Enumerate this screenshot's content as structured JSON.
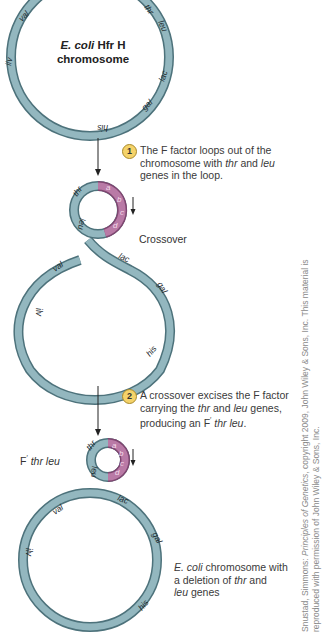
{
  "colors": {
    "chromosome_fill": "#8fb3bb",
    "chromosome_edge": "#4d727b",
    "f_factor_fill": "#b97aa6",
    "f_factor_edge": "#7f4670",
    "step_badge": "#f5d36a"
  },
  "panel1": {
    "title_italic": "E. coli",
    "title_rest": " Hfr H",
    "title_line2": "chromosome",
    "genes": [
      "val",
      "thr",
      "leu",
      "lac",
      "gal",
      "his",
      "ilv"
    ]
  },
  "step1": {
    "number": "1",
    "text_a": "The F factor loops out of the",
    "text_b": "chromosome with ",
    "gene1": "thr",
    "text_c": " and ",
    "gene2": "leu",
    "text_d": "genes in the loop."
  },
  "panel2": {
    "crossover_label": "Crossover",
    "loop_genes": [
      "thr",
      "leu"
    ],
    "f_segments": [
      "a",
      "b",
      "c",
      "d"
    ],
    "genes": [
      "val",
      "lac",
      "gal",
      "ilv",
      "his"
    ]
  },
  "step2": {
    "number": "2",
    "text_a": "A crossover excises the F factor",
    "text_b": "carrying the ",
    "gene1": "thr",
    "text_c": " and ",
    "gene2": "leu",
    "text_d": " genes,",
    "text_e": "producing an F",
    "prime": "′",
    "product": " thr leu",
    "text_f": "."
  },
  "panel3": {
    "label_prefix": "F",
    "label_prime": "′",
    "label_genes": " thr leu",
    "genes": [
      "thr",
      "leu"
    ],
    "f_segments": [
      "a",
      "b",
      "c",
      "d"
    ]
  },
  "panel4": {
    "genes": [
      "val",
      "lac",
      "gal",
      "ilv",
      "his"
    ],
    "caption_italic": "E. coli",
    "caption_a": " chromosome with",
    "caption_b": "a deletion of ",
    "gene1": "thr",
    "caption_c": " and",
    "gene2": "leu",
    "caption_d": " genes"
  },
  "credit": {
    "line1_a": "Snustad, Simmons: ",
    "line1_title": "Principles of Genetics",
    "line1_b": ", copyright 2009, John Wiley & Sons, Inc. This material is",
    "line2": "reproduced with permission of John Wiley & Sons, Inc."
  }
}
